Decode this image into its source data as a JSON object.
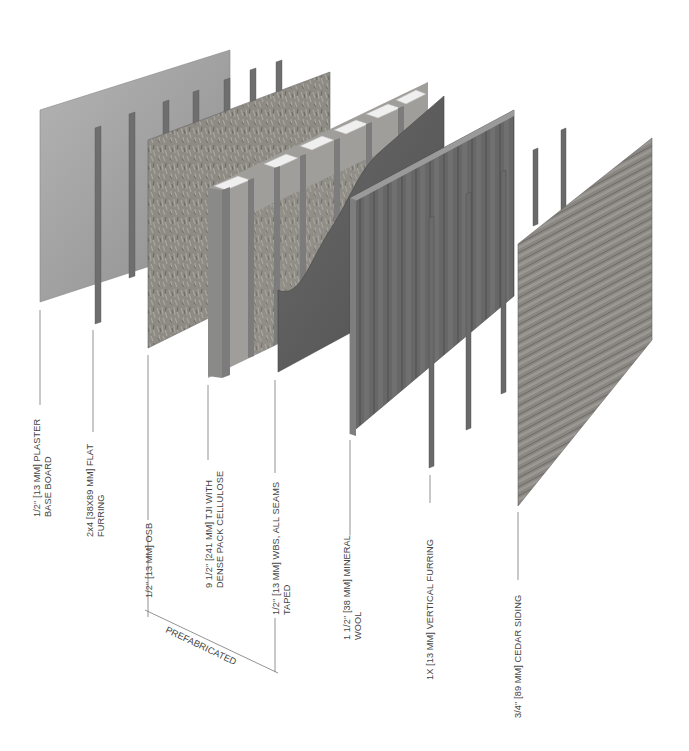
{
  "diagram": {
    "type": "exploded-wall-assembly-axonometric",
    "layers": [
      {
        "id": "plaster",
        "label_lines": [
          "1/2\" [13 MM] PLASTER",
          "BASE BOARD"
        ]
      },
      {
        "id": "flat-furring",
        "label_lines": [
          "2x4 [38X89 MM] FLAT",
          "FURRING"
        ]
      },
      {
        "id": "osb",
        "label_lines": [
          "1/2\" [13 MM] OSB"
        ]
      },
      {
        "id": "tji",
        "label_lines": [
          "9 1/2\" [241 MM] TJI WITH",
          "DENSE PACK CELLULOSE"
        ]
      },
      {
        "id": "wbs",
        "label_lines": [
          "1/2\" [13 MM] WBS, ALL SEAMS",
          "TAPED"
        ]
      },
      {
        "id": "mineral-wool",
        "label_lines": [
          "1 1/2\" [38 MM] MINERAL",
          "WOOL"
        ]
      },
      {
        "id": "vertical-furring",
        "label_lines": [
          "1X [13 MM] VERTICAL FURRING"
        ]
      },
      {
        "id": "cedar-siding",
        "label_lines": [
          "3/4\" [89 MM] CEDAR SIDING"
        ]
      }
    ],
    "bracket_label": "PREFABRICATED",
    "colors": {
      "plaster": "#a8a8a8",
      "furring": "#6e6e6e",
      "osb": "#8c8882",
      "tji_face": "#9a9a98",
      "tji_top": "#ececec",
      "wbs": "#5e5e5e",
      "mineral_wool": "#6a6a6a",
      "cedar": "#8a8682",
      "leader": "#777777",
      "text": "#444444"
    }
  }
}
